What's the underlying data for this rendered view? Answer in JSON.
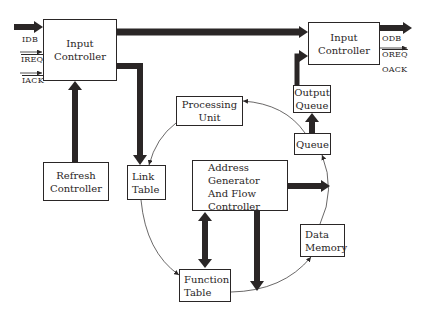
{
  "diagram": {
    "type": "block-diagram",
    "nodes": {
      "input_controller_left": {
        "lines": [
          "Input",
          "Controller"
        ]
      },
      "input_controller_right": {
        "lines": [
          "Input",
          "Controller"
        ]
      },
      "output_queue": {
        "lines": [
          "Output",
          "Queue"
        ]
      },
      "queue": {
        "lines": [
          "Queue"
        ]
      },
      "processing_unit": {
        "lines": [
          "Processing",
          "Unit"
        ]
      },
      "refresh_controller": {
        "lines": [
          "Refresh",
          "Controller"
        ]
      },
      "link_table": {
        "lines": [
          "Link",
          "Table"
        ]
      },
      "address_generator": {
        "lines": [
          "Address",
          "Generator",
          "And Flow",
          "Controller"
        ]
      },
      "data_memory": {
        "lines": [
          "Data",
          "Memory"
        ]
      },
      "function_table": {
        "lines": [
          "Function",
          "Table"
        ]
      }
    },
    "signals": {
      "input": [
        "IDB",
        "IREQ",
        "IACK"
      ],
      "output": [
        "ODB",
        "OREQ",
        "OACK"
      ]
    },
    "edges": [
      {
        "from": "IDB",
        "to": "Input Controller (left)",
        "style": "thick"
      },
      {
        "from": "IREQ",
        "to": "Input Controller (left)",
        "style": "thin"
      },
      {
        "from": "IACK",
        "to": "Input Controller (left)",
        "style": "thin"
      },
      {
        "from": "Input Controller (left)",
        "to": "Input Controller (right)",
        "style": "thick"
      },
      {
        "from": "Input Controller (left)",
        "to": "Link Table",
        "style": "thick"
      },
      {
        "from": "Refresh Controller",
        "to": "Input Controller (left)",
        "style": "thick"
      },
      {
        "from": "Queue",
        "to": "Output Queue",
        "style": "thick"
      },
      {
        "from": "Output Queue",
        "to": "Input Controller (right)",
        "style": "thick"
      },
      {
        "from": "Input Controller (right)",
        "to": "ODB",
        "style": "thick"
      },
      {
        "from": "Input Controller (right)",
        "to": "OREQ",
        "style": "thin"
      },
      {
        "from": "Address Generator And Flow Controller",
        "to": "right",
        "style": "thick"
      },
      {
        "from": "Address Generator And Flow Controller",
        "to": "Function Table",
        "style": "thick-bidirectional"
      },
      {
        "from": "Address Generator And Flow Controller",
        "to": "down",
        "style": "thick"
      },
      {
        "from": "Queue",
        "to": "Processing Unit",
        "style": "thin-curve"
      },
      {
        "from": "Processing Unit",
        "to": "Link Table",
        "style": "thin-curve"
      },
      {
        "from": "Link Table",
        "to": "Function Table",
        "style": "thin-curve"
      },
      {
        "from": "Function Table",
        "to": "Data Memory",
        "style": "thin-curve"
      },
      {
        "from": "Data Memory",
        "to": "Queue",
        "style": "thin-curve"
      }
    ]
  },
  "colors": {
    "ink": "#2a2626",
    "background": "#ffffff"
  }
}
